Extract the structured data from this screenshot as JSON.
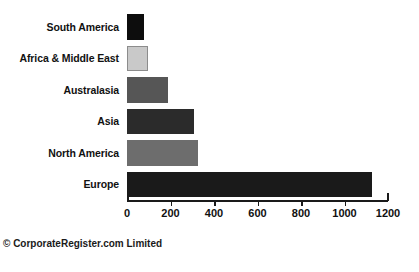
{
  "chart_data": {
    "type": "bar",
    "orientation": "horizontal",
    "title": "",
    "subtitle": "",
    "xlabel": "",
    "ylabel": "",
    "categories": [
      "South America",
      "Africa & Middle East",
      "Australasia",
      "Asia",
      "North America",
      "Europe"
    ],
    "values": [
      78,
      97,
      189,
      308,
      326,
      1125
    ],
    "series": [
      {
        "name": "Reports",
        "values": [
          78,
          97,
          189,
          308,
          326,
          1125
        ]
      }
    ],
    "bar_colors": [
      "#0d0d0d",
      "#c9c9c9",
      "#565656",
      "#2b2b2b",
      "#6d6d6d",
      "#1a1a1a"
    ],
    "bar_outline_colors": [
      "none",
      "#8c8c8c",
      "none",
      "none",
      "none",
      "none"
    ],
    "xlim": [
      0,
      1200
    ],
    "x_ticks": [
      0,
      200,
      400,
      600,
      800,
      1000,
      1200
    ],
    "x_tick_labels": [
      "0",
      "200",
      "400",
      "600",
      "800",
      "1000",
      "1200"
    ],
    "grid": false,
    "legend": false,
    "legend_position": "none"
  },
  "footer": {
    "copyright": "© CorporateRegister.com Limited"
  }
}
